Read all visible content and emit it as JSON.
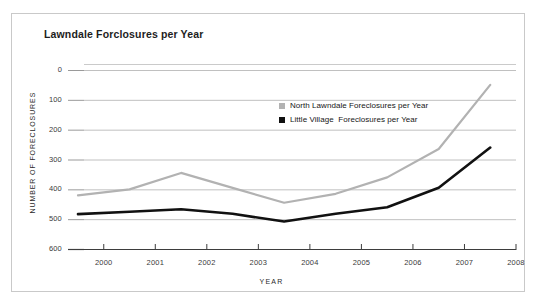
{
  "figure": {
    "title": "Lawndale Forclosures per Year",
    "border_color": "#c9c9c9",
    "background": "#ffffff"
  },
  "axes": {
    "ylabel": "NUMBER OF FORECLOSURES",
    "xlabel": "YEAR",
    "yticks": [
      "600",
      "500",
      "400",
      "300",
      "200",
      "100",
      "0"
    ],
    "xticks": [
      "2000",
      "2001",
      "2002",
      "2003",
      "2004",
      "2005",
      "2006",
      "2007",
      "2008"
    ]
  },
  "legend": {
    "items": [
      {
        "label": "North Lawndale Foreclosures per Year",
        "color": "#b2b2b2",
        "marker": "square"
      },
      {
        "label": "Little Village  Foreclosures per Year",
        "color": "#111111",
        "marker": "square"
      }
    ]
  },
  "chart_data": {
    "type": "line",
    "title": "Lawndale Forclosures per Year",
    "xlabel": "YEAR",
    "ylabel": "NUMBER OF FORECLOSURES",
    "xlim": [
      1999.5,
      2008
    ],
    "ylim": [
      0,
      620
    ],
    "yticks": [
      0,
      100,
      200,
      300,
      400,
      500,
      600
    ],
    "xticks": [
      2000,
      2001,
      2002,
      2003,
      2004,
      2005,
      2006,
      2007,
      2008
    ],
    "grid": "horizontal",
    "legend_position": "upper center",
    "x": [
      1999.5,
      2000.5,
      2001.5,
      2002.5,
      2003.5,
      2004.5,
      2005.5,
      2006.5,
      2007.5
    ],
    "series": [
      {
        "name": "North Lawndale Foreclosures per Year",
        "color": "#b2b2b2",
        "values": [
          180,
          200,
          255,
          205,
          155,
          185,
          240,
          335,
          550
        ]
      },
      {
        "name": "Little Village  Foreclosures per Year",
        "color": "#111111",
        "values": [
          117,
          125,
          133,
          118,
          92,
          118,
          140,
          205,
          340
        ]
      }
    ]
  }
}
